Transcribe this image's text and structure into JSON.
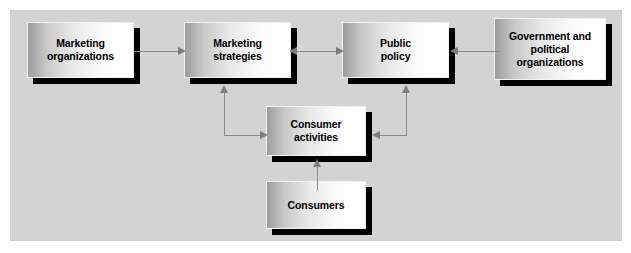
{
  "diagram": {
    "panel_color": "#d3d3d3",
    "box_gradient_from": "#9d9d9d",
    "box_gradient_to": "#ffffff",
    "shadow_color": "#000000",
    "connector_color": "#8a8a8a",
    "nodes": [
      {
        "id": "marketing-organizations",
        "line1": "Marketing",
        "line2": "organizations",
        "line3": ""
      },
      {
        "id": "marketing-strategies",
        "line1": "Marketing",
        "line2": "strategies",
        "line3": ""
      },
      {
        "id": "public-policy",
        "line1": "Public",
        "line2": "policy",
        "line3": ""
      },
      {
        "id": "government-and-political-organizations",
        "line1": "Government and",
        "line2": "political",
        "line3": "organizations"
      },
      {
        "id": "consumer-activities",
        "line1": "Consumer",
        "line2": "activities",
        "line3": ""
      },
      {
        "id": "consumers",
        "line1": "Consumers",
        "line2": "",
        "line3": ""
      }
    ],
    "connectors": [
      {
        "id": "marketing-organizations-to-marketing-strategies",
        "from": "Marketing organizations",
        "to": "Marketing strategies",
        "direction": "one-way-right"
      },
      {
        "id": "marketing-strategies-to-public-policy",
        "from": "Marketing strategies",
        "to": "Public policy",
        "direction": "two-way"
      },
      {
        "id": "government-to-public-policy",
        "from": "Government and political organizations",
        "to": "Public policy",
        "direction": "one-way-left"
      },
      {
        "id": "consumer-activities-to-marketing-strategies",
        "from": "Consumer activities",
        "to": "Marketing strategies",
        "direction": "two-way-elbow-left"
      },
      {
        "id": "consumer-activities-to-public-policy",
        "from": "Consumer activities",
        "to": "Public policy",
        "direction": "two-way-elbow-right"
      },
      {
        "id": "consumers-to-consumer-activities",
        "from": "Consumers",
        "to": "Consumer activities",
        "direction": "one-way-up"
      }
    ]
  }
}
